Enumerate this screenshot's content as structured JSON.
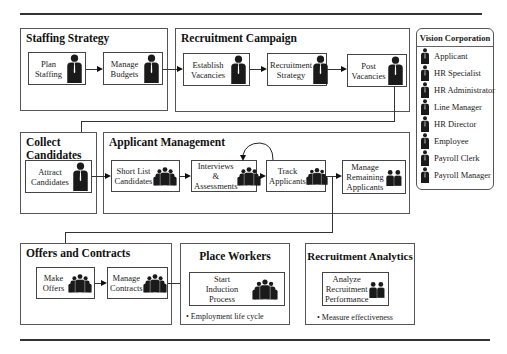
{
  "diagram": {
    "groups": [
      {
        "id": "staffing-strategy",
        "title": "Staffing Strategy"
      },
      {
        "id": "recruitment-campaign",
        "title": "Recruitment Campaign"
      },
      {
        "id": "collect-candidates",
        "title": "Collect\nCandidates"
      },
      {
        "id": "applicant-management",
        "title": "Applicant Management"
      },
      {
        "id": "offers-and-contracts",
        "title": "Offers and Contracts"
      },
      {
        "id": "place-workers",
        "title": "Place Workers"
      },
      {
        "id": "recruitment-analytics",
        "title": "Recruitment Analytics"
      }
    ],
    "steps": {
      "plan_staffing": "Plan\nStaffing",
      "manage_budgets": "Manage\nBudgets",
      "establish_vacancies": "Establish\nVacancies",
      "recruitment_strategy": "Recruitment\nStrategy",
      "post_vacancies": "Post\nVacancies",
      "attract_candidates": "Attract\nCandidates",
      "short_list_candidates": "Short List\nCandidates",
      "interviews_assessments": "Interviews &\nAssessments",
      "track_applicants": "Track\nApplicants",
      "manage_remaining_applicants": "Manage\nRemaining\nApplicants",
      "make_offers": "Make\nOffers",
      "manage_contracts": "Manage\nContracts",
      "start_induction_process": "Start\nInduction\nProcess",
      "analyze_recruitment_performance": "Analyze\nRecruitment\nPerformance"
    },
    "notes": {
      "place_workers": "• Employment life cycle",
      "recruitment_analytics": "• Measure effectiveness"
    }
  },
  "legend": {
    "title": "Vision Corporation",
    "items": [
      {
        "label": "Applicant",
        "icon": "person-icon"
      },
      {
        "label": "HR Specialist",
        "icon": "person-icon"
      },
      {
        "label": "HR Administrator",
        "icon": "person-icon"
      },
      {
        "label": "Line Manager",
        "icon": "person-icon"
      },
      {
        "label": "HR Director",
        "icon": "person-icon"
      },
      {
        "label": "Employee",
        "icon": "person-icon"
      },
      {
        "label": "Payroll Clerk",
        "icon": "person-icon"
      },
      {
        "label": "Payroll Manager",
        "icon": "person-icon"
      }
    ]
  },
  "colors": {
    "line": "#333333",
    "border": "#555555",
    "figure": "#1a1a1a",
    "background": "#ffffff"
  }
}
